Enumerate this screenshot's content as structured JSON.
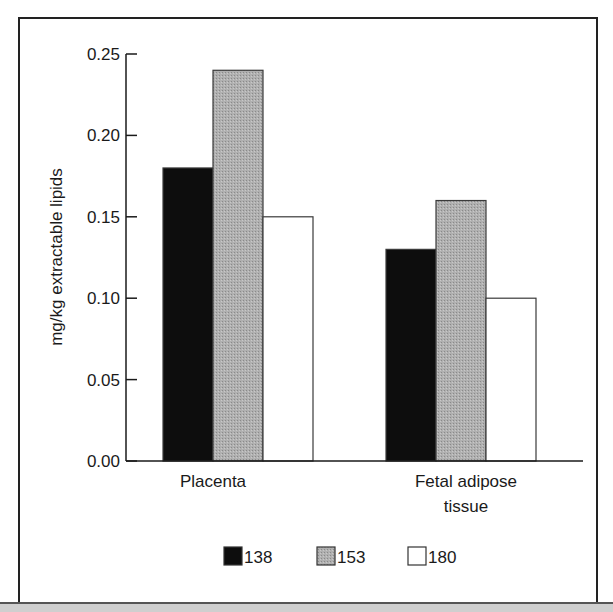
{
  "chart_data": {
    "type": "bar",
    "title": "",
    "xlabel": "",
    "ylabel": "mg/kg extractable lipids",
    "ylim": [
      0,
      0.25
    ],
    "yticks": [
      "0.00",
      "0.05",
      "0.10",
      "0.15",
      "0.20",
      "0.25"
    ],
    "categories": [
      "Placenta",
      "Fetal adipose tissue"
    ],
    "category_label_lines": [
      [
        "Placenta"
      ],
      [
        "Fetal adipose",
        "tissue"
      ]
    ],
    "series": [
      {
        "name": "138",
        "values": [
          0.18,
          0.13
        ],
        "color": "#0d0d0d"
      },
      {
        "name": "153",
        "values": [
          0.24,
          0.16
        ],
        "color": "#a9a9a9"
      },
      {
        "name": "180",
        "values": [
          0.15,
          0.1
        ],
        "color": "#ffffff"
      }
    ],
    "grid": false,
    "legend_position": "bottom"
  },
  "colors": {
    "axis": "#1a1a1a",
    "bar_outline": "#3a3a3a",
    "frame": "#222222",
    "footer_band": "#cfcfcf"
  }
}
